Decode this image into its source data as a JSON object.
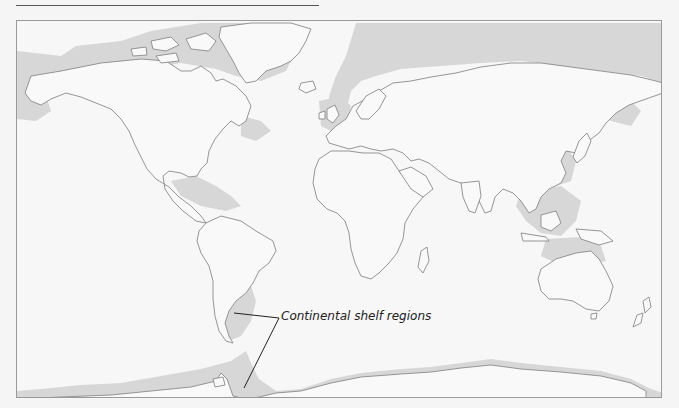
{
  "map": {
    "title": "",
    "projection": "world-equirectangular",
    "legend": {
      "label": "Continental shelf regions",
      "pointers": [
        "south-america-patagonian-shelf",
        "antarctic-peninsula-shelf"
      ]
    },
    "colors": {
      "page_background": "#f5f5f5",
      "ocean": "#f7f7f7",
      "land": "#f9f9f9",
      "coastline": "#8a8a8a",
      "continental_shelf": "#d7d7d7",
      "frame_border": "#9a9a9a",
      "leader_line": "#222222"
    }
  }
}
